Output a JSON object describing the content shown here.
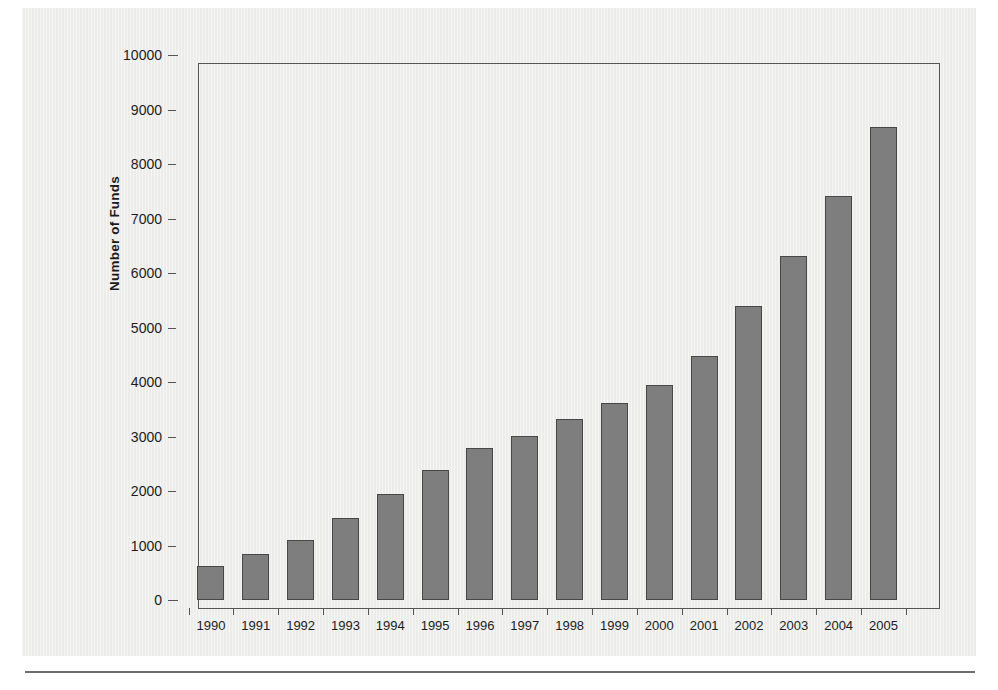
{
  "chart_data": {
    "type": "bar",
    "title": "",
    "subtitle": "",
    "xlabel": "",
    "ylabel": "Number of Funds",
    "categories": [
      "1990",
      "1991",
      "1992",
      "1993",
      "1994",
      "1995",
      "1996",
      "1997",
      "1998",
      "1999",
      "2000",
      "2001",
      "2002",
      "2003",
      "2004",
      "2005"
    ],
    "values": [
      620,
      840,
      1100,
      1500,
      1940,
      2380,
      2790,
      3010,
      3320,
      3620,
      3940,
      4480,
      5400,
      6320,
      7420,
      8680
    ],
    "ylim": [
      0,
      10000
    ],
    "ytick_labels": [
      "0",
      "1000",
      "2000",
      "3000",
      "4000",
      "5000",
      "6000",
      "7000",
      "8000",
      "9000",
      "10000"
    ],
    "ytick_values": [
      0,
      1000,
      2000,
      3000,
      4000,
      5000,
      6000,
      7000,
      8000,
      9000,
      10000
    ],
    "grid": false,
    "legend": "none",
    "bar_fill_color": "#7e7e7e",
    "bar_border_color": "#474747",
    "axis_color": "#555555",
    "panel_color": "#ececeb",
    "text_color": "#1c1c1c"
  },
  "figure": {
    "rule_visible": true
  }
}
